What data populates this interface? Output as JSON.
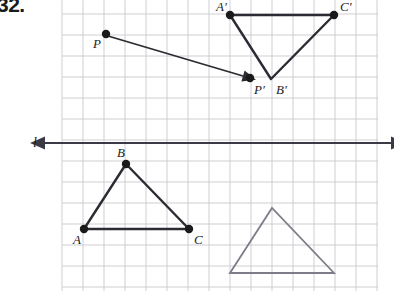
{
  "problem": {
    "number": "32."
  },
  "figure": {
    "caption_hidden": "Reflection of triangle ABC and point P across line l",
    "grid": {
      "x_start": 62,
      "y_start": 14,
      "x_end": 378,
      "y_end": 291,
      "spacing": 21,
      "color": "#c9c9cf",
      "line_width": 0.9
    },
    "mirror_line": {
      "label": "l",
      "label_x": 33,
      "label_y": 147,
      "y": 143,
      "x_from": 45,
      "x_to": 391,
      "color": "#3a3a44",
      "width": 2.0,
      "arrow_left": true,
      "arrow_right": true
    },
    "preimage_points": [
      {
        "name": "A",
        "x": 84,
        "y": 229,
        "label_x": 73,
        "label_y": 244,
        "dot": true
      },
      {
        "name": "B",
        "x": 126,
        "y": 164,
        "label_x": 117,
        "label_y": 157,
        "dot": true
      },
      {
        "name": "C",
        "x": 189,
        "y": 229,
        "label_x": 194,
        "label_y": 244,
        "dot": true
      },
      {
        "name": "P",
        "x": 106,
        "y": 34,
        "label_x": 93,
        "label_y": 48,
        "dot": true
      }
    ],
    "image_points": [
      {
        "name": "A′",
        "x": 230,
        "y": 15,
        "label_x": 216,
        "label_y": 11,
        "dot": true
      },
      {
        "name": "B′",
        "x": 271,
        "y": 79,
        "label_x": 276,
        "label_y": 94,
        "dot": false
      },
      {
        "name": "C′",
        "x": 334,
        "y": 15,
        "label_x": 340,
        "label_y": 11,
        "dot": true
      },
      {
        "name": "P′",
        "x": 250,
        "y": 78,
        "label_x": 254,
        "label_y": 94,
        "dot": true
      }
    ],
    "triangle_abc": {
      "name": "triangle-abc",
      "points": "84,229 126,164 189,229",
      "color": "#2b2b33",
      "width": 2.4
    },
    "triangle_a_prime": {
      "name": "triangle-a-prime-b-prime-c-prime",
      "points": "230,15 271,79 334,15",
      "color": "#2b2b33",
      "width": 2.4
    },
    "triangle_gray": {
      "name": "triangle-gray-outline",
      "points": "230,273 272,208 334,273",
      "color": "#7d7d88",
      "width": 1.8
    },
    "vector_pp": {
      "name": "vector-p-to-p-prime",
      "x1": 108,
      "y1": 36,
      "x2": 243,
      "y2": 76,
      "color": "#2b2b33",
      "width": 1.8
    },
    "dot_radius": 4.2,
    "dot_color": "#1a1a1a"
  }
}
